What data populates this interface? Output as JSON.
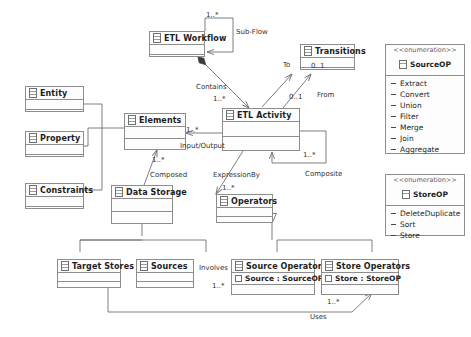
{
  "diagram": {
    "line_color": "#6f6f6f",
    "box_fill": "#fdfdfd",
    "text_color": "#1d1d1d"
  },
  "classes": [
    {
      "id": "etl-workflow",
      "name": "ETL Workflow",
      "attributes": []
    },
    {
      "id": "transitions",
      "name": "Transitions",
      "attributes": []
    },
    {
      "id": "entity",
      "name": "Entity",
      "attributes": []
    },
    {
      "id": "property",
      "name": "Property",
      "attributes": []
    },
    {
      "id": "constraints",
      "name": "Constraints",
      "attributes": []
    },
    {
      "id": "elements",
      "name": "Elements",
      "attributes": []
    },
    {
      "id": "etl-activity",
      "name": "ETL Activity",
      "attributes": []
    },
    {
      "id": "data-storage",
      "name": "Data Storage",
      "attributes": []
    },
    {
      "id": "operators",
      "name": "Operators",
      "attributes": []
    },
    {
      "id": "target-stores",
      "name": "Target Stores",
      "attributes": []
    },
    {
      "id": "sources",
      "name": "Sources",
      "attributes": []
    },
    {
      "id": "source-operators",
      "name": "Source Operators",
      "attributes": [
        "Source : SourceOP"
      ]
    },
    {
      "id": "store-operators",
      "name": "Store Operators",
      "attributes": [
        "Store : StoreOP"
      ]
    }
  ],
  "enumerations": [
    {
      "id": "sourceop",
      "stereotype": "<<enumeration>>",
      "name": "SourceOP",
      "literals": [
        "Extract",
        "Convert",
        "Union",
        "Filter",
        "Merge",
        "Join",
        "Aggregate"
      ]
    },
    {
      "id": "storeop",
      "stereotype": "<<enumeration>>",
      "name": "StoreOP",
      "literals": [
        "DeleteDuplicate",
        "Sort",
        "Store"
      ]
    }
  ],
  "relationships": [
    {
      "id": "sub-flow",
      "label": "Sub-Flow",
      "multiplicity": "1..*"
    },
    {
      "id": "contains",
      "label": "Contains",
      "multiplicity": "1..*"
    },
    {
      "id": "to",
      "label": "To",
      "multiplicity": "0..1"
    },
    {
      "id": "from",
      "label": "From",
      "multiplicity": "0..1"
    },
    {
      "id": "input-output",
      "label": "Input/Output",
      "multiplicity": "1..*"
    },
    {
      "id": "composed",
      "label": "Composed",
      "multiplicity": "1..*"
    },
    {
      "id": "expressionby",
      "label": "ExpressionBy",
      "multiplicity": "1..*"
    },
    {
      "id": "composite",
      "label": "Composite",
      "multiplicity": "1..*"
    },
    {
      "id": "involves",
      "label": "Involves",
      "multiplicity": "1..*"
    },
    {
      "id": "uses",
      "label": "Uses",
      "multiplicity": "1..*"
    }
  ],
  "labels": {
    "sub_flow": "Sub-Flow",
    "contains": "Contains",
    "to": "To",
    "from": "From",
    "input_output": "Input/Output",
    "composed": "Composed",
    "expressionby": "ExpressionBy",
    "composite": "Composite",
    "involves": "Involves",
    "uses": "Uses"
  },
  "multiplicities": {
    "sub_flow": "1..*",
    "contains": "1..*",
    "to": "0..1",
    "from": "0..1",
    "input_output": "1..*",
    "composed": "1..*",
    "expressionby": "1..*",
    "composite": "1..*",
    "involves": "1..*",
    "uses": "1..*"
  }
}
